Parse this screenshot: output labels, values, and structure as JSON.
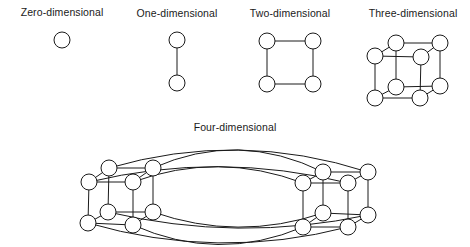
{
  "diagrams": [
    {
      "label": "Zero-dimensional",
      "label_pos": [
        62,
        13
      ]
    },
    {
      "label": "One-dimensional",
      "label_pos": [
        177,
        14
      ]
    },
    {
      "label": "Two-dimensional",
      "label_pos": [
        290,
        14
      ]
    },
    {
      "label": "Three-dimensional",
      "label_pos": [
        413,
        14
      ]
    },
    {
      "label": "Four-dimensional",
      "label_pos": [
        235,
        128
      ]
    }
  ],
  "graphs": {
    "zero": {
      "nodes": [
        [
          62,
          40
        ]
      ],
      "edges": []
    },
    "one": {
      "nodes": [
        [
          177,
          40
        ],
        [
          177,
          83
        ]
      ],
      "edges": [
        [
          0,
          1
        ]
      ]
    },
    "two": {
      "nodes": [
        [
          267,
          41
        ],
        [
          313,
          41
        ],
        [
          267,
          84
        ],
        [
          313,
          84
        ]
      ],
      "edges": [
        [
          0,
          1
        ],
        [
          0,
          2
        ],
        [
          1,
          3
        ],
        [
          2,
          3
        ]
      ]
    },
    "three": {
      "nodes": [
        [
          396,
          43
        ],
        [
          440,
          43
        ],
        [
          396,
          87
        ],
        [
          440,
          86
        ],
        [
          375,
          56
        ],
        [
          421,
          57
        ],
        [
          375,
          98
        ],
        [
          420,
          98
        ]
      ],
      "edges": [
        [
          0,
          1
        ],
        [
          0,
          2
        ],
        [
          1,
          3
        ],
        [
          2,
          3
        ],
        [
          4,
          5
        ],
        [
          4,
          6
        ],
        [
          5,
          7
        ],
        [
          6,
          7
        ],
        [
          0,
          4
        ],
        [
          1,
          5
        ],
        [
          2,
          6
        ],
        [
          3,
          7
        ]
      ]
    },
    "four": {
      "nodes": [
        [
          109,
          168
        ],
        [
          153,
          168
        ],
        [
          108,
          212
        ],
        [
          153,
          212
        ],
        [
          89,
          182
        ],
        [
          133,
          182
        ],
        [
          88,
          223
        ],
        [
          133,
          225
        ],
        [
          368,
          172
        ],
        [
          323,
          172
        ],
        [
          368,
          215
        ],
        [
          323,
          213
        ],
        [
          348,
          183
        ],
        [
          303,
          183
        ],
        [
          348,
          227
        ],
        [
          303,
          227
        ]
      ],
      "edges": [
        [
          0,
          1
        ],
        [
          0,
          2
        ],
        [
          1,
          3
        ],
        [
          2,
          3
        ],
        [
          4,
          5
        ],
        [
          4,
          6
        ],
        [
          5,
          7
        ],
        [
          6,
          7
        ],
        [
          0,
          4
        ],
        [
          1,
          5
        ],
        [
          2,
          6
        ],
        [
          3,
          7
        ],
        [
          8,
          9
        ],
        [
          8,
          10
        ],
        [
          9,
          11
        ],
        [
          10,
          11
        ],
        [
          12,
          13
        ],
        [
          12,
          14
        ],
        [
          13,
          15
        ],
        [
          14,
          15
        ],
        [
          8,
          12
        ],
        [
          9,
          13
        ],
        [
          10,
          14
        ],
        [
          11,
          15
        ]
      ],
      "long_edges": [
        [
          0,
          8
        ],
        [
          1,
          9
        ],
        [
          4,
          12
        ],
        [
          5,
          13
        ],
        [
          2,
          10
        ],
        [
          3,
          11
        ],
        [
          6,
          14
        ],
        [
          7,
          15
        ]
      ]
    }
  },
  "node_radius": 8,
  "colors": {
    "stroke": "#1a1a1a",
    "fill": "#ffffff",
    "background": "#ffffff"
  }
}
